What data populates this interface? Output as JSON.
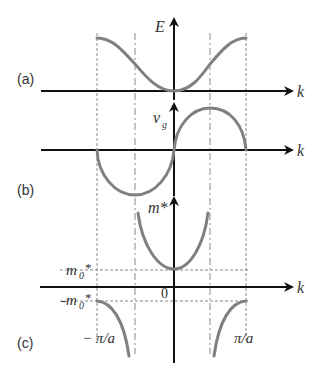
{
  "figure": {
    "panels": [
      {
        "id": "a",
        "label": "(a)",
        "y_axis_label": "E",
        "x_axis_label": "k",
        "curve": "energy dispersion E(k) ~ 1 - cos(ka)"
      },
      {
        "id": "b",
        "label": "(b)",
        "y_axis_label": "v",
        "y_axis_subscript": "g",
        "x_axis_label": "k",
        "curve": "group velocity v_g ~ sin(ka)"
      },
      {
        "id": "c",
        "label": "(c)",
        "y_axis_label": "m*",
        "x_axis_label": "k",
        "curve": "effective mass m* ~ 1/cos(ka)"
      }
    ],
    "annotations": {
      "m0_star": "m",
      "m0_sub": "0",
      "m0_suffix": "*",
      "neg_m0_prefix": "-m",
      "origin": "0",
      "neg_pi_over_a": "− π/a",
      "pi_over_a": "π/a"
    },
    "x_markers": [
      "-π/a",
      "-π/2a",
      "0",
      "π/2a",
      "π/a"
    ],
    "colors": {
      "axis": "#111111",
      "curve": "#808080",
      "guide": "#888888"
    }
  }
}
